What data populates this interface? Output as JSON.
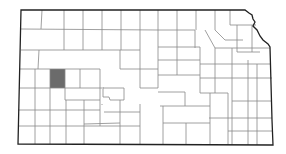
{
  "map": {
    "region": "Kansas",
    "subdivision": "counties",
    "highlighted_county": {
      "name": "Scott County",
      "color": "#6b6b6b"
    },
    "fill_color": "#ffffff",
    "border_color": "#222222",
    "county_line_color": "#888888"
  }
}
